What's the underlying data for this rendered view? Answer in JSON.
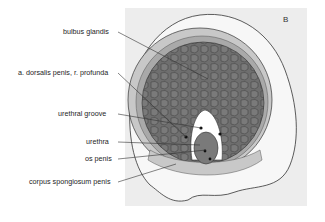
{
  "figure": {
    "panel_label": "B",
    "labels": [
      {
        "id": "bulbus_glandis",
        "text": "bulbus glandis"
      },
      {
        "id": "a_dorsalis",
        "text": "a. dorsalis penis, r. profunda"
      },
      {
        "id": "urethral_groove",
        "text": "urethral groove"
      },
      {
        "id": "urethra",
        "text": "urethra"
      },
      {
        "id": "os_penis",
        "text": "os penis"
      },
      {
        "id": "corpus_spongiosum",
        "text": "corpus spongiosum penis"
      }
    ],
    "colors": {
      "panel_bg": "#ededed",
      "tissue_dark": "#6e6e6e",
      "ring_mid": "#a9a9a9",
      "ring_light": "#c8c8c8",
      "outer_skin": "#f6f6f6",
      "outline": "#333333"
    }
  }
}
